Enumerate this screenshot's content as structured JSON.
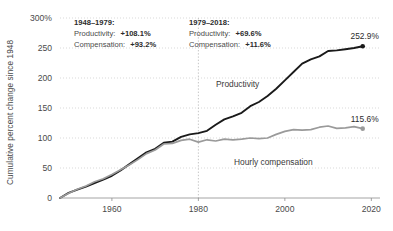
{
  "chart_data": {
    "type": "line",
    "title": "",
    "xlabel": "",
    "ylabel": "Cumulative percent change since 1948",
    "xlim": [
      1948,
      2022
    ],
    "ylim": [
      0,
      300
    ],
    "yticks": [
      0,
      50,
      100,
      150,
      200,
      250,
      300
    ],
    "ytick_labels": [
      "0",
      "50",
      "100",
      "150",
      "200",
      "250",
      "300%"
    ],
    "xticks": [
      1960,
      1980,
      2000,
      2020
    ],
    "xtick_labels": [
      "1960",
      "1980",
      "2000",
      "2020"
    ],
    "grid": true,
    "legend_position": "inline-labels",
    "divider_year": 1980,
    "series": [
      {
        "name": "Productivity",
        "color": "#1a1a1a",
        "end_label": "252.9%",
        "end_value": 252.9,
        "x": [
          1948,
          1950,
          1952,
          1954,
          1956,
          1958,
          1960,
          1962,
          1964,
          1966,
          1968,
          1970,
          1972,
          1974,
          1976,
          1978,
          1980,
          1982,
          1984,
          1986,
          1988,
          1990,
          1992,
          1994,
          1996,
          1998,
          2000,
          2002,
          2004,
          2006,
          2008,
          2010,
          2012,
          2014,
          2016,
          2018
        ],
        "values": [
          0,
          8.5,
          14.0,
          19.0,
          25.0,
          30.5,
          37.0,
          46.0,
          56.0,
          66.0,
          76.0,
          82.0,
          92.0,
          94.0,
          102.0,
          106.0,
          108.1,
          112.0,
          122.0,
          131.0,
          136.0,
          142.0,
          153.0,
          160.0,
          170.0,
          182.0,
          196.0,
          210.0,
          224.0,
          231.0,
          236.0,
          245.0,
          246.0,
          248.0,
          250.0,
          252.9
        ]
      },
      {
        "name": "Hourly compensation",
        "color": "#9a9a9a",
        "end_label": "115.6%",
        "end_value": 115.6,
        "x": [
          1948,
          1950,
          1952,
          1954,
          1956,
          1958,
          1960,
          1962,
          1964,
          1966,
          1968,
          1970,
          1972,
          1974,
          1976,
          1978,
          1980,
          1982,
          1984,
          1986,
          1988,
          1990,
          1992,
          1994,
          1996,
          1998,
          2000,
          2002,
          2004,
          2006,
          2008,
          2010,
          2012,
          2014,
          2016,
          2018
        ],
        "values": [
          0,
          8.0,
          14.5,
          20.0,
          27.0,
          32.0,
          39.0,
          47.0,
          55.0,
          64.0,
          74.0,
          80.0,
          90.0,
          91.0,
          96.0,
          98.0,
          93.2,
          97.0,
          95.0,
          98.0,
          97.0,
          98.0,
          100.0,
          99.0,
          100.0,
          106.0,
          111.0,
          114.0,
          113.0,
          114.0,
          118.0,
          120.0,
          116.0,
          117.0,
          119.0,
          115.6
        ]
      }
    ],
    "annotations": [
      {
        "id": "period-1",
        "heading": "1948–1979:",
        "rows": [
          {
            "label": "Productivity:",
            "value": "+108.1%"
          },
          {
            "label": "Compensation:",
            "value": "+93.2%"
          }
        ]
      },
      {
        "id": "period-2",
        "heading": "1979–2018:",
        "rows": [
          {
            "label": "Productivity:",
            "value": "+69.6%"
          },
          {
            "label": "Compensation:",
            "value": "+11.6%"
          }
        ]
      }
    ]
  }
}
